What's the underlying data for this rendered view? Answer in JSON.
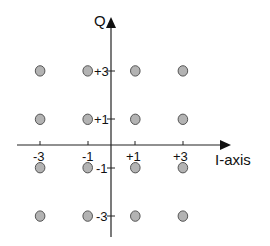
{
  "diagram": {
    "type": "constellation",
    "axes": {
      "i_axis_label": "I-axis",
      "q_axis_label": "Q",
      "i_ticks": [
        "-3",
        "-1",
        "+1",
        "+3"
      ],
      "q_ticks": [
        "+3",
        "+1",
        "-1",
        "-3"
      ]
    },
    "colors": {
      "point_fill": "#b3b3b3",
      "point_stroke": "#555555",
      "axis": "#222222",
      "text": "#111111"
    }
  },
  "chart_data": {
    "type": "scatter",
    "title": "",
    "xlabel": "I-axis",
    "ylabel": "Q",
    "x_ticks": [
      -3,
      -1,
      1,
      3
    ],
    "y_ticks": [
      3,
      1,
      -1,
      -3
    ],
    "xlim": [
      -4,
      5
    ],
    "ylim": [
      -4,
      5
    ],
    "grid": false,
    "points": [
      {
        "i": -3,
        "q": 3
      },
      {
        "i": -1,
        "q": 3
      },
      {
        "i": 1,
        "q": 3
      },
      {
        "i": 3,
        "q": 3
      },
      {
        "i": -3,
        "q": 1
      },
      {
        "i": -1,
        "q": 1
      },
      {
        "i": 1,
        "q": 1
      },
      {
        "i": 3,
        "q": 1
      },
      {
        "i": -3,
        "q": -1
      },
      {
        "i": -1,
        "q": -1
      },
      {
        "i": 1,
        "q": -1
      },
      {
        "i": 3,
        "q": -1
      },
      {
        "i": -3,
        "q": -3
      },
      {
        "i": -1,
        "q": -3
      },
      {
        "i": 1,
        "q": -3
      },
      {
        "i": 3,
        "q": -3
      }
    ]
  }
}
